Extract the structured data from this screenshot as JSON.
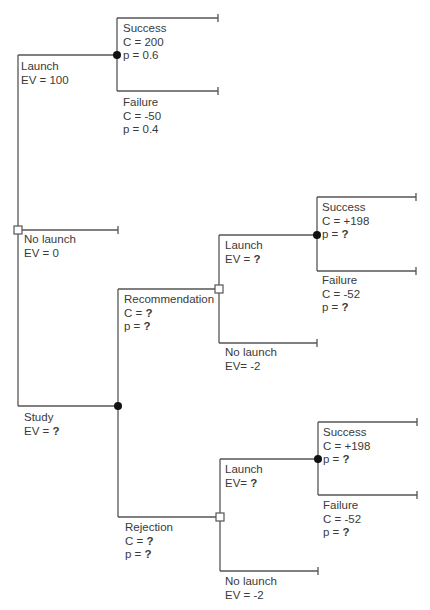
{
  "diagram": {
    "type": "decision-tree",
    "colors": {
      "line": "#555555",
      "chance_node": "#111111",
      "decision_node_fill": "#ffffff",
      "text": "#3a3a3a"
    },
    "root": {
      "node_type": "decision",
      "branches": {
        "launch": {
          "label": "Launch",
          "ev_prefix": "EV = ",
          "ev": "100",
          "node_type": "chance",
          "outcomes": {
            "success": {
              "label": "Success",
              "c_prefix": "C = ",
              "c": "200",
              "p_prefix": "p = ",
              "p": "0.6"
            },
            "failure": {
              "label": "Failure",
              "c_prefix": "C = ",
              "c": "-50",
              "p_prefix": "p = ",
              "p": "0.4"
            }
          }
        },
        "no_launch": {
          "label": "No launch",
          "ev_prefix": "EV = ",
          "ev": "0"
        },
        "study": {
          "label": "Study",
          "ev_prefix": "EV = ",
          "ev": "?",
          "node_type": "chance",
          "outcomes": {
            "recommendation": {
              "label": "Recommendation",
              "c_prefix": "C = ",
              "c": "?",
              "p_prefix": "p = ",
              "p": "?",
              "node_type": "decision",
              "launch": {
                "label": "Launch",
                "ev_prefix": "EV = ",
                "ev": "?",
                "success": {
                  "label": "Success",
                  "c_prefix": "C = ",
                  "c": "+198",
                  "p_prefix": "p = ",
                  "p": "?"
                },
                "failure": {
                  "label": "Failure",
                  "c_prefix": "C = ",
                  "c": "-52",
                  "p_prefix": "p = ",
                  "p": "?"
                }
              },
              "no_launch": {
                "label": "No launch",
                "ev_prefix": "EV= ",
                "ev": "-2"
              }
            },
            "rejection": {
              "label": "Rejection",
              "c_prefix": "C = ",
              "c": "?",
              "p_prefix": "p = ",
              "p": "?",
              "node_type": "decision",
              "launch": {
                "label": "Launch",
                "ev_prefix": "EV= ",
                "ev": "?",
                "success": {
                  "label": "Success",
                  "c_prefix": "C = ",
                  "c": "+198",
                  "p_prefix": "p = ",
                  "p": "?"
                },
                "failure": {
                  "label": "Failure",
                  "c_prefix": "C = ",
                  "c": "-52",
                  "p_prefix": "p = ",
                  "p": "?"
                }
              },
              "no_launch": {
                "label": "No launch",
                "ev_prefix": "EV = ",
                "ev": "-2"
              }
            }
          }
        }
      }
    }
  }
}
